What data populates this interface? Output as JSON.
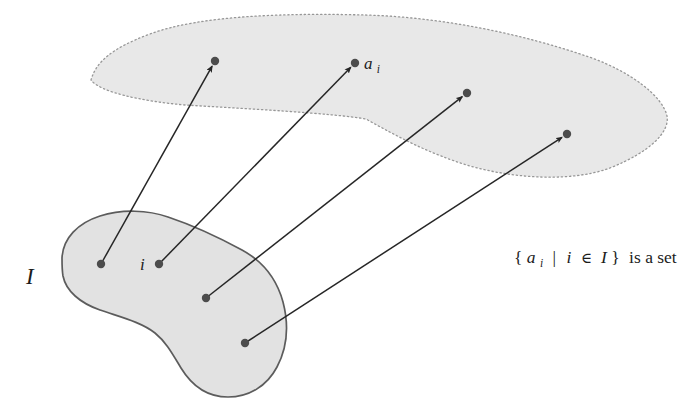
{
  "figure": {
    "labels": {
      "index_set": "I",
      "index_element": "i",
      "family_element_base": "a",
      "family_element_sub": "i"
    },
    "caption": {
      "open_brace": "{",
      "a": "a",
      "a_sub": "i",
      "bar": "|",
      "i": "i",
      "element_of": "∈",
      "index_set": "I",
      "close_brace": "}",
      "suffix": "is a set"
    },
    "colors": {
      "background": "#ffffff",
      "family_region_fill": "#e8e8e8",
      "family_region_border": "#979797",
      "index_region_fill": "#e2e2e2",
      "index_region_border": "#5c5c5c",
      "dot": "#4c4c4c",
      "arrow": "#262626",
      "text": "#1c1c1c"
    }
  }
}
